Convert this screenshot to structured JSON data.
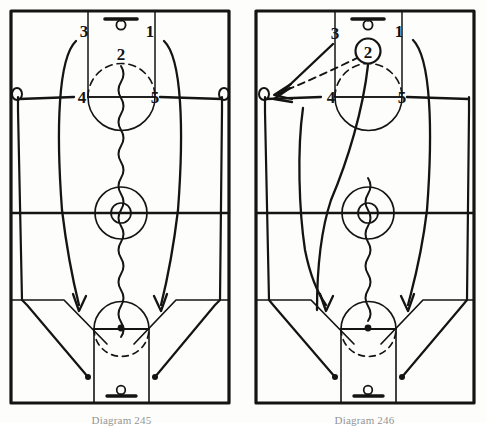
{
  "page": {
    "background_color": "#fdfdfb",
    "ink_color": "#1a1a1a",
    "width": 486,
    "height": 423
  },
  "diagrams": [
    {
      "id": "diagram-245",
      "caption": "Diagram 245",
      "side": "left",
      "description": "Five-player alignment with wing players 3 and 1 curling to the basket, 4 and 5 starting wide off screens, and 2 dribbling the ball up the middle of the floor.",
      "players": [
        {
          "label": "1",
          "x": 148,
          "y": 34,
          "has_ball": false,
          "role": "right-wing"
        },
        {
          "label": "2",
          "x": 120,
          "y": 52,
          "has_ball": false,
          "role": "point-guard"
        },
        {
          "label": "3",
          "x": 84,
          "y": 31,
          "has_ball": false,
          "role": "left-wing"
        },
        {
          "label": "4",
          "x": 81,
          "y": 97,
          "has_ball": false,
          "role": "left-post"
        },
        {
          "label": "5",
          "x": 152,
          "y": 97,
          "has_ball": false,
          "role": "right-post"
        }
      ],
      "actions": [
        {
          "type": "dribble",
          "actor": "2",
          "style": "wavy",
          "note": "dribbles from top of key down past center circle to far free-throw line"
        },
        {
          "type": "cut",
          "actor": "3",
          "style": "solid-arrow",
          "note": "curls from left elbow down the left lane to far free-throw line extended"
        },
        {
          "type": "cut",
          "actor": "1",
          "style": "solid-arrow",
          "note": "curls from right elbow down the right lane to far free-throw line extended"
        },
        {
          "type": "cut",
          "actor": "4",
          "style": "solid-line",
          "note": "runs from left wing along sideline to far left corner"
        },
        {
          "type": "cut",
          "actor": "5",
          "style": "solid-line",
          "note": "runs from right wing along sideline to far right corner"
        }
      ],
      "markers": [
        {
          "type": "screen-loop",
          "x": 15,
          "y": 95,
          "note": "left screen / start marker"
        },
        {
          "type": "screen-loop",
          "x": 222,
          "y": 95,
          "note": "right screen / start marker"
        }
      ]
    },
    {
      "id": "diagram-246",
      "caption": "Diagram 246",
      "side": "right",
      "description": "Continuation: 2 holds the ball at the top of the key and passes to the left wing while 3 cuts across; 1 and the post players continue their runs toward the far basket.",
      "players": [
        {
          "label": "1",
          "x": 155,
          "y": 32,
          "has_ball": false,
          "role": "right-wing"
        },
        {
          "label": "2",
          "x": 127,
          "y": 51,
          "has_ball": true,
          "role": "ball-handler"
        },
        {
          "label": "3",
          "x": 89,
          "y": 34,
          "has_ball": false,
          "role": "left-wing"
        },
        {
          "label": "4",
          "x": 86,
          "y": 96,
          "has_ball": false,
          "role": "left-post"
        },
        {
          "label": "5",
          "x": 155,
          "y": 96,
          "has_ball": false,
          "role": "right-post"
        }
      ],
      "actions": [
        {
          "type": "pass",
          "actor": "2",
          "target": "left-wing",
          "style": "dashed-arrow",
          "note": "dashed pass line from 2 out to the left wing"
        },
        {
          "type": "cut",
          "actor": "3",
          "style": "solid-arrow",
          "note": "3 cuts from left elbow down toward the left wing receiving spot"
        },
        {
          "type": "drive",
          "actor": "2",
          "style": "wavy",
          "note": "ball continues down the floor with a dribble toward the far free-throw line"
        },
        {
          "type": "cut",
          "actor": "1",
          "style": "solid-arrow",
          "note": "curls from right elbow down the right lane to far free-throw line extended"
        },
        {
          "type": "cut",
          "actor": "4",
          "style": "solid-line",
          "note": "runs from left wing along sideline to far left corner"
        },
        {
          "type": "cut",
          "actor": "5",
          "style": "solid-line",
          "note": "runs from right wing along sideline to far right corner"
        }
      ],
      "markers": [
        {
          "type": "screen-loop",
          "x": 18,
          "y": 94,
          "note": "left screen / receive marker"
        }
      ]
    }
  ],
  "court": {
    "legend": {
      "solid_line": "player cut / movement",
      "wavy_line": "dribble",
      "dashed_line": "pass",
      "circled_number": "player with the ball",
      "loop": "screen"
    },
    "features": [
      "boundary",
      "half-court line",
      "center circle",
      "center inner circle",
      "top free-throw lane",
      "top free-throw circle",
      "top backboard and rim",
      "bottom free-throw lane",
      "bottom free-throw circle",
      "bottom backboard and rim",
      "three-point line"
    ]
  }
}
